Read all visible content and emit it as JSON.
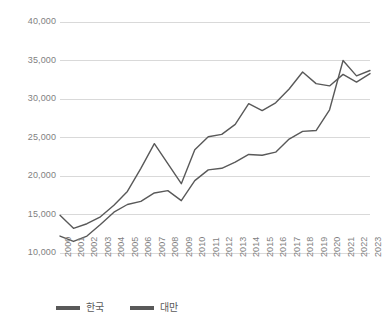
{
  "chart_data": {
    "type": "line",
    "title": "",
    "subtitle": "",
    "xlabel": "",
    "ylabel": "",
    "grid": true,
    "legend_position": "bottom-left",
    "ylim": [
      10000,
      40000
    ],
    "ytick_values": [
      10000,
      15000,
      20000,
      25000,
      30000,
      35000,
      40000
    ],
    "ytick_labels": [
      "10,000",
      "15,000",
      "20,000",
      "25,000",
      "30,000",
      "35,000",
      "40,000"
    ],
    "categories": [
      "2000",
      "2001",
      "2002",
      "2003",
      "2004",
      "2005",
      "2006",
      "2007",
      "2008",
      "2009",
      "2010",
      "2011",
      "2012",
      "2013",
      "2014",
      "2015",
      "2016",
      "2017",
      "2018",
      "2019",
      "2020",
      "2021",
      "2022",
      "2023"
    ],
    "x": [
      2000,
      2001,
      2002,
      2003,
      2004,
      2005,
      2006,
      2007,
      2008,
      2009,
      2010,
      2011,
      2012,
      2013,
      2014,
      2015,
      2016,
      2017,
      2018,
      2019,
      2020,
      2021,
      2022,
      2023
    ],
    "series": [
      {
        "name": "한국",
        "color": "#595959",
        "values": [
          14900,
          13200,
          13800,
          14700,
          16200,
          18000,
          21000,
          24200,
          21600,
          19000,
          23400,
          25100,
          25400,
          26700,
          29400,
          28500,
          29500,
          31300,
          33500,
          32000,
          31700,
          33200,
          32200,
          33300
        ]
      },
      {
        "name": "대만",
        "color": "#595959",
        "values": [
          12200,
          11500,
          12200,
          13700,
          15300,
          16300,
          16700,
          17800,
          18100,
          16800,
          19400,
          20800,
          21000,
          21800,
          22800,
          22700,
          23100,
          24800,
          25800,
          25900,
          28600,
          35000,
          33000,
          33700
        ]
      }
    ]
  },
  "legend": {
    "items": [
      {
        "label": "한국",
        "color": "#595959"
      },
      {
        "label": "대만",
        "color": "#595959"
      }
    ]
  },
  "style": {
    "gridline_color": "#d9d9d9",
    "tick_text_color": "#7f7f7f",
    "plot_background": "#ffffff"
  }
}
